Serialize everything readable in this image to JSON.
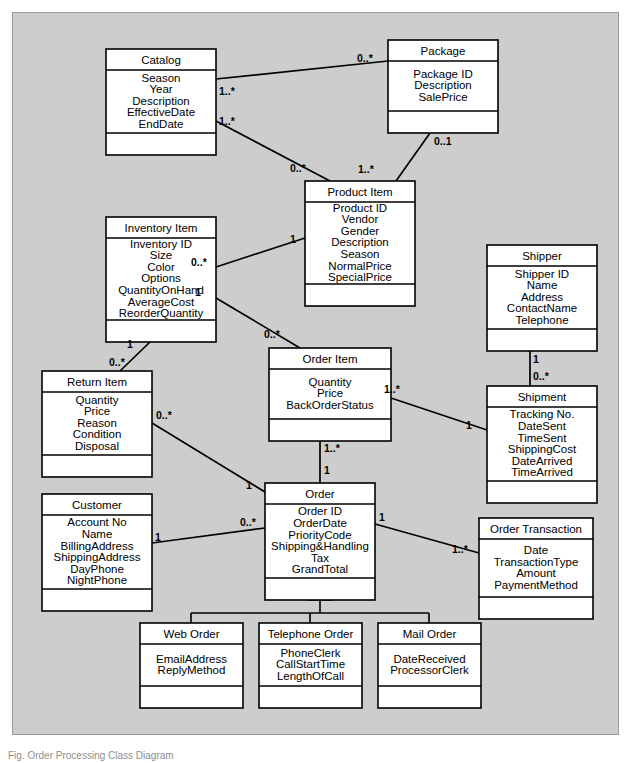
{
  "figure": {
    "type": "uml-class-diagram",
    "caption_fragment": "Fig. Order Processing Class Diagram",
    "background_color": "#cdcdcd",
    "class_fill": "#ffffff",
    "line_color": "#000000"
  },
  "classes": [
    {
      "id": "catalog",
      "name": "Catalog",
      "attributes": [
        "Season",
        "Year",
        "Description",
        "EffectiveDate",
        "EndDate"
      ],
      "x": 106,
      "y": 49,
      "w": 110,
      "hdr": 21,
      "body": 63,
      "foot": 22
    },
    {
      "id": "package",
      "name": "Package",
      "attributes": [
        "Package ID",
        "Description",
        "SalePrice"
      ],
      "x": 388,
      "y": 40,
      "w": 110,
      "hdr": 21,
      "body": 50,
      "foot": 22
    },
    {
      "id": "product_item",
      "name": "Product Item",
      "attributes": [
        "Product ID",
        "Vendor",
        "Gender",
        "Description",
        "Season",
        "NormalPrice",
        "SpecialPrice"
      ],
      "x": 305,
      "y": 181,
      "w": 110,
      "hdr": 21,
      "body": 82,
      "foot": 22
    },
    {
      "id": "inventory_item",
      "name": "Inventory Item",
      "attributes": [
        "Inventory ID",
        "Size",
        "Color",
        "Options",
        "QuantityOnHand",
        "AverageCost",
        "ReorderQuantity"
      ],
      "x": 106,
      "y": 217,
      "w": 110,
      "hdr": 21,
      "body": 82,
      "foot": 22
    },
    {
      "id": "shipper",
      "name": "Shipper",
      "attributes": [
        "Shipper ID",
        "Name",
        "Address",
        "ContactName",
        "Telephone"
      ],
      "x": 487,
      "y": 245,
      "w": 110,
      "hdr": 21,
      "body": 63,
      "foot": 22
    },
    {
      "id": "order_item",
      "name": "Order Item",
      "attributes": [
        "Quantity",
        "Price",
        "BackOrderStatus"
      ],
      "x": 269,
      "y": 348,
      "w": 122,
      "hdr": 21,
      "body": 50,
      "foot": 22
    },
    {
      "id": "return_item",
      "name": "Return Item",
      "attributes": [
        "Quantity",
        "Price",
        "Reason",
        "Condition",
        "Disposal"
      ],
      "x": 42,
      "y": 371,
      "w": 110,
      "hdr": 21,
      "body": 63,
      "foot": 22
    },
    {
      "id": "shipment",
      "name": "Shipment",
      "attributes": [
        "Tracking No.",
        "DateSent",
        "TimeSent",
        "ShippingCost",
        "DateArrived",
        "TimeArrived"
      ],
      "x": 487,
      "y": 386,
      "w": 110,
      "hdr": 21,
      "body": 74,
      "foot": 22
    },
    {
      "id": "customer",
      "name": "Customer",
      "attributes": [
        "Account No",
        "Name",
        "BillingAddress",
        "ShippingAddress",
        "DayPhone",
        "NightPhone"
      ],
      "x": 42,
      "y": 494,
      "w": 110,
      "hdr": 21,
      "body": 74,
      "foot": 22
    },
    {
      "id": "order",
      "name": "Order",
      "attributes": [
        "Order ID",
        "OrderDate",
        "PriorityCode",
        "Shipping&Handling",
        "Tax",
        "GrandTotal"
      ],
      "x": 265,
      "y": 483,
      "w": 110,
      "hdr": 21,
      "body": 74,
      "foot": 22
    },
    {
      "id": "order_transaction",
      "name": "Order Transaction",
      "attributes": [
        "Date",
        "TransactionType",
        "Amount",
        "PaymentMethod"
      ],
      "x": 479,
      "y": 518,
      "w": 114,
      "hdr": 21,
      "body": 58,
      "foot": 22
    },
    {
      "id": "web_order",
      "name": "Web Order",
      "attributes": [
        "EmailAddress",
        "ReplyMethod"
      ],
      "x": 140,
      "y": 623,
      "w": 103,
      "hdr": 21,
      "body": 42,
      "foot": 22
    },
    {
      "id": "telephone_order",
      "name": "Telephone Order",
      "attributes": [
        "PhoneClerk",
        "CallStartTime",
        "LengthOfCall"
      ],
      "x": 259,
      "y": 623,
      "w": 103,
      "hdr": 21,
      "body": 42,
      "foot": 22
    },
    {
      "id": "mail_order",
      "name": "Mail Order",
      "attributes": [
        "DateReceived",
        "ProcessorClerk"
      ],
      "x": 378,
      "y": 623,
      "w": 103,
      "hdr": 21,
      "body": 42,
      "foot": 22
    }
  ],
  "associations": [
    {
      "id": "catalog-package",
      "from": "catalog",
      "to": "package",
      "from_mult": "1..*",
      "to_mult": "0..*",
      "x1": 216,
      "y1": 79,
      "x2": 388,
      "y2": 61,
      "fm_x": 219,
      "fm_y": 95,
      "tm_x": 357,
      "tm_y": 62
    },
    {
      "id": "catalog-product",
      "from": "catalog",
      "to": "product_item",
      "from_mult": "1..*",
      "to_mult": "0..*",
      "x1": 216,
      "y1": 121,
      "x2": 330,
      "y2": 181,
      "fm_x": 219,
      "fm_y": 125,
      "tm_x": 290,
      "tm_y": 172
    },
    {
      "id": "package-product",
      "from": "package",
      "to": "product_item",
      "from_mult": "0..1",
      "to_mult": "1..*",
      "x1": 430,
      "y1": 133,
      "x2": 396,
      "y2": 181,
      "fm_x": 434,
      "fm_y": 145,
      "tm_x": 358,
      "tm_y": 173
    },
    {
      "id": "inventory-product",
      "from": "inventory_item",
      "to": "product_item",
      "from_mult": "0..*",
      "to_mult": "1",
      "x1": 216,
      "y1": 267,
      "x2": 305,
      "y2": 238,
      "fm_x": 191,
      "fm_y": 266,
      "tm_x": 290,
      "tm_y": 243
    },
    {
      "id": "inventory-orderitem",
      "from": "inventory_item",
      "to": "order_item",
      "from_mult": "1",
      "to_mult": "0..*",
      "x1": 216,
      "y1": 298,
      "x2": 300,
      "y2": 348,
      "fm_x": 195,
      "fm_y": 296,
      "tm_x": 264,
      "tm_y": 338
    },
    {
      "id": "inventory-returnitem",
      "from": "inventory_item",
      "to": "return_item",
      "from_mult": "1",
      "to_mult": "0..*",
      "x1": 150,
      "y1": 342,
      "x2": 120,
      "y2": 371,
      "fm_x": 127,
      "fm_y": 348,
      "tm_x": 109,
      "tm_y": 366
    },
    {
      "id": "orderitem-shipment",
      "from": "order_item",
      "to": "shipment",
      "from_mult": "1..*",
      "to_mult": "1",
      "x1": 391,
      "y1": 398,
      "x2": 487,
      "y2": 430,
      "fm_x": 384,
      "fm_y": 393,
      "tm_x": 466,
      "tm_y": 429
    },
    {
      "id": "shipper-shipment",
      "from": "shipper",
      "to": "shipment",
      "from_mult": "1",
      "to_mult": "0..*",
      "x1": 530,
      "y1": 351,
      "x2": 530,
      "y2": 386,
      "fm_x": 533,
      "fm_y": 363,
      "tm_x": 533,
      "tm_y": 380
    },
    {
      "id": "orderitem-order",
      "from": "order_item",
      "to": "order",
      "from_mult": "1..*",
      "to_mult": "1",
      "x1": 320,
      "y1": 441,
      "x2": 320,
      "y2": 483,
      "fm_x": 324,
      "fm_y": 452,
      "tm_x": 324,
      "tm_y": 474
    },
    {
      "id": "returnitem-order",
      "from": "return_item",
      "to": "order",
      "from_mult": "0..*",
      "to_mult": "1",
      "x1": 152,
      "y1": 423,
      "x2": 265,
      "y2": 492,
      "fm_x": 156,
      "fm_y": 419,
      "tm_x": 246,
      "tm_y": 489
    },
    {
      "id": "customer-order",
      "from": "customer",
      "to": "order",
      "from_mult": "1",
      "to_mult": "0..*",
      "x1": 152,
      "y1": 543,
      "x2": 265,
      "y2": 528,
      "fm_x": 155,
      "fm_y": 541,
      "tm_x": 240,
      "tm_y": 526
    },
    {
      "id": "order-transaction",
      "from": "order",
      "to": "order_transaction",
      "from_mult": "1",
      "to_mult": "1..*",
      "x1": 375,
      "y1": 524,
      "x2": 479,
      "y2": 553,
      "fm_x": 379,
      "fm_y": 521,
      "tm_x": 452,
      "tm_y": 553
    }
  ],
  "generalization": {
    "id": "order-subtypes",
    "parent": "order",
    "children": [
      "web_order",
      "telephone_order",
      "mail_order"
    ],
    "apex_x": 320,
    "apex_y": 600,
    "bus_y": 613,
    "child_xs": [
      191,
      310,
      429
    ],
    "child_top": 623
  }
}
